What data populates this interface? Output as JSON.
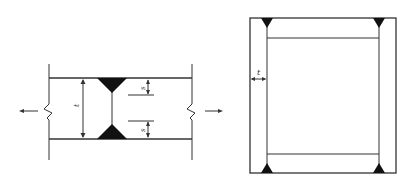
{
  "figure": {
    "left": {
      "title": "butt weld section",
      "labels": {
        "thickness": "t",
        "throat_top": "s",
        "throat_bottom": "s"
      },
      "load_arrows": [
        "left",
        "right"
      ]
    },
    "right": {
      "title": "box section with corner welds",
      "labels": {
        "thickness": "t"
      }
    },
    "colors": {
      "line": "#333333",
      "weld": "#111111",
      "background": "#ffffff"
    }
  }
}
